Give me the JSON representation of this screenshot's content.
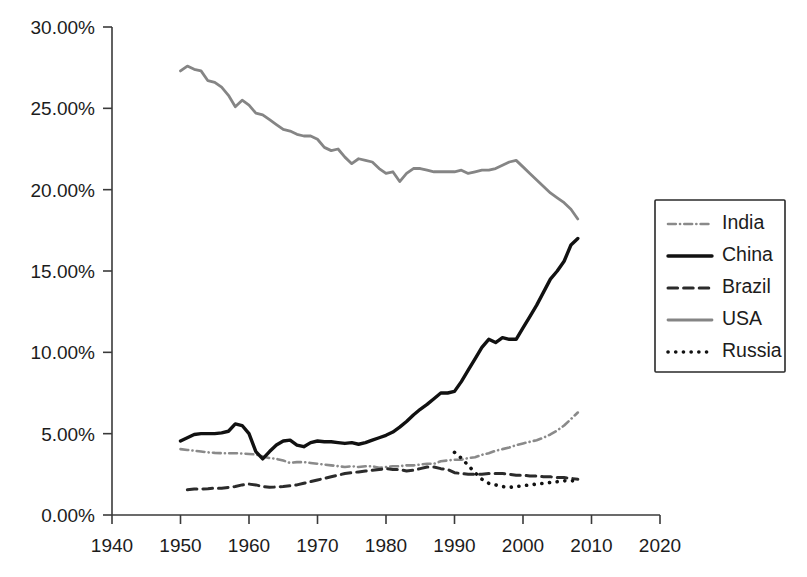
{
  "chart_data": {
    "type": "line",
    "title": "",
    "subtitle": "",
    "xlabel": "",
    "ylabel": "",
    "xlim": [
      1940,
      2020
    ],
    "ylim": [
      0,
      30
    ],
    "grid": false,
    "legend_position": "right",
    "x_ticks": [
      1940,
      1950,
      1960,
      1970,
      1980,
      1990,
      2000,
      2010,
      2020
    ],
    "x_tick_labels": [
      "1940",
      "1950",
      "1960",
      "1970",
      "1980",
      "1990",
      "2000",
      "2010",
      "2020"
    ],
    "y_ticks": [
      0,
      5,
      10,
      15,
      20,
      25,
      30
    ],
    "y_tick_labels": [
      "0.00%",
      "5.00%",
      "10.00%",
      "15.00%",
      "20.00%",
      "25.00%",
      "30.00%"
    ],
    "y_unit": "%",
    "series": [
      {
        "name": "India",
        "style": "dash-dot",
        "color": "#8a8a8a",
        "width": 2.6,
        "x": [
          1950,
          1951,
          1952,
          1953,
          1954,
          1955,
          1956,
          1957,
          1958,
          1959,
          1960,
          1961,
          1962,
          1963,
          1964,
          1965,
          1966,
          1967,
          1968,
          1969,
          1970,
          1971,
          1972,
          1973,
          1974,
          1975,
          1976,
          1977,
          1978,
          1979,
          1980,
          1981,
          1982,
          1983,
          1984,
          1985,
          1986,
          1987,
          1988,
          1989,
          1990,
          1991,
          1992,
          1993,
          1994,
          1995,
          1996,
          1997,
          1998,
          1999,
          2000,
          2001,
          2002,
          2003,
          2004,
          2005,
          2006,
          2007,
          2008
        ],
        "values": [
          4.05,
          4.0,
          3.95,
          3.9,
          3.85,
          3.82,
          3.8,
          3.8,
          3.8,
          3.78,
          3.75,
          3.72,
          3.6,
          3.5,
          3.45,
          3.35,
          3.2,
          3.25,
          3.25,
          3.2,
          3.15,
          3.1,
          3.05,
          3.0,
          2.95,
          3.0,
          2.95,
          3.0,
          3.0,
          2.9,
          2.95,
          3.0,
          3.0,
          3.05,
          3.05,
          3.1,
          3.15,
          3.15,
          3.3,
          3.35,
          3.4,
          3.4,
          3.5,
          3.55,
          3.7,
          3.8,
          3.95,
          4.05,
          4.15,
          4.3,
          4.4,
          4.5,
          4.6,
          4.75,
          4.95,
          5.2,
          5.5,
          5.9,
          6.3
        ]
      },
      {
        "name": "China",
        "style": "solid",
        "color": "#111111",
        "width": 3.4,
        "x": [
          1950,
          1951,
          1952,
          1953,
          1954,
          1955,
          1956,
          1957,
          1958,
          1959,
          1960,
          1961,
          1962,
          1963,
          1964,
          1965,
          1966,
          1967,
          1968,
          1969,
          1970,
          1971,
          1972,
          1973,
          1974,
          1975,
          1976,
          1977,
          1978,
          1979,
          1980,
          1981,
          1982,
          1983,
          1984,
          1985,
          1986,
          1987,
          1988,
          1989,
          1990,
          1991,
          1992,
          1993,
          1994,
          1995,
          1996,
          1997,
          1998,
          1999,
          2000,
          2001,
          2002,
          2003,
          2004,
          2005,
          2006,
          2007,
          2008
        ],
        "values": [
          4.55,
          4.75,
          4.95,
          5.0,
          5.0,
          5.0,
          5.05,
          5.15,
          5.6,
          5.5,
          5.0,
          3.9,
          3.45,
          3.9,
          4.3,
          4.55,
          4.6,
          4.3,
          4.2,
          4.45,
          4.55,
          4.5,
          4.5,
          4.45,
          4.4,
          4.45,
          4.35,
          4.45,
          4.6,
          4.75,
          4.9,
          5.1,
          5.4,
          5.75,
          6.15,
          6.5,
          6.8,
          7.15,
          7.5,
          7.5,
          7.6,
          8.2,
          8.9,
          9.6,
          10.3,
          10.8,
          10.6,
          10.9,
          10.8,
          10.8,
          11.5,
          12.2,
          12.9,
          13.7,
          14.5,
          15.0,
          15.6,
          16.6,
          17.0
        ]
      },
      {
        "name": "Brazil",
        "style": "dashed",
        "color": "#2b2b2b",
        "width": 3.0,
        "x": [
          1951,
          1952,
          1953,
          1954,
          1955,
          1956,
          1957,
          1958,
          1959,
          1960,
          1961,
          1962,
          1963,
          1964,
          1965,
          1966,
          1967,
          1968,
          1969,
          1970,
          1971,
          1972,
          1973,
          1974,
          1975,
          1976,
          1977,
          1978,
          1979,
          1980,
          1981,
          1982,
          1983,
          1984,
          1985,
          1986,
          1987,
          1988,
          1989,
          1990,
          1991,
          1992,
          1993,
          1994,
          1995,
          1996,
          1997,
          1998,
          1999,
          2000,
          2001,
          2002,
          2003,
          2004,
          2005,
          2006,
          2007,
          2008
        ],
        "values": [
          1.55,
          1.6,
          1.6,
          1.62,
          1.65,
          1.65,
          1.7,
          1.75,
          1.85,
          1.9,
          1.85,
          1.75,
          1.7,
          1.72,
          1.75,
          1.8,
          1.85,
          1.95,
          2.05,
          2.15,
          2.25,
          2.35,
          2.45,
          2.55,
          2.6,
          2.65,
          2.7,
          2.75,
          2.8,
          2.85,
          2.8,
          2.8,
          2.7,
          2.75,
          2.85,
          2.95,
          2.95,
          2.85,
          2.8,
          2.6,
          2.55,
          2.5,
          2.5,
          2.5,
          2.55,
          2.55,
          2.55,
          2.5,
          2.45,
          2.45,
          2.4,
          2.4,
          2.35,
          2.35,
          2.3,
          2.3,
          2.25,
          2.2
        ]
      },
      {
        "name": "USA",
        "style": "solid",
        "color": "#858585",
        "width": 2.8,
        "x": [
          1950,
          1951,
          1952,
          1953,
          1954,
          1955,
          1956,
          1957,
          1958,
          1959,
          1960,
          1961,
          1962,
          1963,
          1964,
          1965,
          1966,
          1967,
          1968,
          1969,
          1970,
          1971,
          1972,
          1973,
          1974,
          1975,
          1976,
          1977,
          1978,
          1979,
          1980,
          1981,
          1982,
          1983,
          1984,
          1985,
          1986,
          1987,
          1988,
          1989,
          1990,
          1991,
          1992,
          1993,
          1994,
          1995,
          1996,
          1997,
          1998,
          1999,
          2000,
          2001,
          2002,
          2003,
          2004,
          2005,
          2006,
          2007,
          2008
        ],
        "values": [
          27.3,
          27.6,
          27.4,
          27.3,
          26.7,
          26.6,
          26.3,
          25.8,
          25.1,
          25.5,
          25.2,
          24.7,
          24.6,
          24.3,
          24.0,
          23.7,
          23.6,
          23.4,
          23.3,
          23.3,
          23.1,
          22.6,
          22.4,
          22.5,
          22.0,
          21.6,
          21.9,
          21.8,
          21.7,
          21.3,
          21.0,
          21.1,
          20.5,
          21.0,
          21.3,
          21.3,
          21.2,
          21.1,
          21.1,
          21.1,
          21.1,
          21.2,
          21.0,
          21.1,
          21.2,
          21.2,
          21.3,
          21.5,
          21.7,
          21.8,
          21.4,
          21.0,
          20.6,
          20.2,
          19.8,
          19.5,
          19.2,
          18.8,
          18.2
        ]
      },
      {
        "name": "Russia",
        "style": "dotted",
        "color": "#111111",
        "width": 3.6,
        "x": [
          1990,
          1991,
          1992,
          1993,
          1994,
          1995,
          1996,
          1997,
          1998,
          1999,
          2000,
          2001,
          2002,
          2003,
          2004,
          2005,
          2006,
          2007,
          2008
        ],
        "values": [
          3.85,
          3.5,
          3.05,
          2.6,
          2.2,
          1.95,
          1.85,
          1.75,
          1.7,
          1.75,
          1.8,
          1.85,
          1.9,
          1.95,
          2.0,
          2.05,
          2.1,
          2.1,
          2.1
        ]
      }
    ]
  },
  "legend": {
    "entries": [
      {
        "label": "India"
      },
      {
        "label": "China"
      },
      {
        "label": "Brazil"
      },
      {
        "label": "USA"
      },
      {
        "label": "Russia"
      }
    ]
  }
}
